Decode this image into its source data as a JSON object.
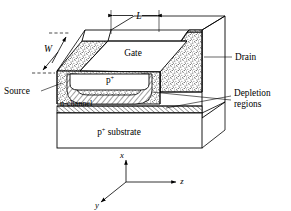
{
  "figure": {
    "background_color": "#ffffff",
    "line_color": "#000000"
  },
  "dimensions": {
    "length_label": "L",
    "width_label": "W"
  },
  "terminals": {
    "gate_label": "Gate",
    "source_label": "Source",
    "drain_label": "Drain"
  },
  "layers": {
    "gate_region_label": "p",
    "gate_region_sup": "+",
    "channel_label": "n-channel",
    "substrate_label": "p",
    "substrate_sup": "+",
    "substrate_name": " substrate"
  },
  "callouts": {
    "depletion_line1": "Depletion",
    "depletion_line2": "regions"
  },
  "axes": {
    "x_label": "x",
    "y_label": "y",
    "z_label": "z"
  }
}
